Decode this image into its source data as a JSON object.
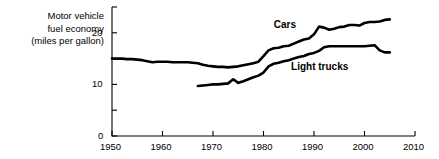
{
  "chart_data": {
    "type": "line",
    "title": "",
    "ylabel": "Motor vehicle fuel economy (miles per gallon)",
    "ylabel_lines": [
      "Motor vehicle",
      "fuel economy",
      "(miles per gallon)"
    ],
    "xlabel": "",
    "xlim": [
      1950,
      2010
    ],
    "ylim": [
      0,
      25
    ],
    "xticks": [
      1950,
      1960,
      1970,
      1980,
      1990,
      2000,
      2010
    ],
    "xtick_labels": [
      "1950",
      "1960",
      "1970",
      "1980",
      "1990",
      "2000",
      "2010"
    ],
    "yticks": [
      0,
      5,
      10,
      15,
      20,
      25
    ],
    "ytick_labels": [
      "0",
      "",
      "10",
      "",
      "20",
      ""
    ],
    "grid": false,
    "legend": "inline-annotations",
    "line_color": "#000000",
    "axis_color": "#000000",
    "background": "#ffffff",
    "series": [
      {
        "name": "Cars",
        "label_x": 1986,
        "label_y": 21.5,
        "x": [
          1950,
          1951,
          1952,
          1953,
          1954,
          1955,
          1956,
          1957,
          1958,
          1959,
          1960,
          1961,
          1962,
          1963,
          1964,
          1965,
          1966,
          1967,
          1968,
          1969,
          1970,
          1971,
          1972,
          1973,
          1974,
          1975,
          1976,
          1977,
          1978,
          1979,
          1980,
          1981,
          1982,
          1983,
          1984,
          1985,
          1986,
          1987,
          1988,
          1989,
          1990,
          1991,
          1992,
          1993,
          1994,
          1995,
          1996,
          1997,
          1998,
          1999,
          2000,
          2001,
          2002,
          2003,
          2004,
          2005
        ],
        "values": [
          15.0,
          15.0,
          15.0,
          14.9,
          14.9,
          14.8,
          14.7,
          14.5,
          14.3,
          14.4,
          14.4,
          14.4,
          14.3,
          14.3,
          14.3,
          14.3,
          14.2,
          14.1,
          13.8,
          13.6,
          13.5,
          13.4,
          13.4,
          13.3,
          13.4,
          13.5,
          13.7,
          13.9,
          14.1,
          14.4,
          15.5,
          16.6,
          17.0,
          17.1,
          17.4,
          17.5,
          17.9,
          18.3,
          18.7,
          18.9,
          19.7,
          21.2,
          21.0,
          20.6,
          20.8,
          21.1,
          21.2,
          21.5,
          21.5,
          21.4,
          21.9,
          22.1,
          22.1,
          22.2,
          22.5,
          22.6
        ]
      },
      {
        "name": "Light trucks",
        "label_x": 1991,
        "label_y": 13.3,
        "x": [
          1967,
          1968,
          1969,
          1970,
          1971,
          1972,
          1973,
          1974,
          1975,
          1976,
          1977,
          1978,
          1979,
          1980,
          1981,
          1982,
          1983,
          1984,
          1985,
          1986,
          1987,
          1988,
          1989,
          1990,
          1991,
          1992,
          1993,
          1994,
          1995,
          1996,
          1997,
          1998,
          1999,
          2000,
          2001,
          2002,
          2003,
          2004,
          2005
        ],
        "values": [
          9.7,
          9.8,
          9.9,
          10.0,
          10.0,
          10.1,
          10.2,
          11.0,
          10.3,
          10.6,
          11.0,
          11.4,
          11.7,
          12.3,
          13.5,
          14.0,
          14.2,
          14.5,
          14.7,
          15.0,
          15.3,
          15.5,
          15.9,
          16.1,
          16.5,
          17.2,
          17.4,
          17.4,
          17.4,
          17.4,
          17.4,
          17.4,
          17.4,
          17.4,
          17.5,
          17.6,
          16.6,
          16.2,
          16.2
        ]
      }
    ]
  },
  "figure": {
    "plot_left_px": 112,
    "plot_right_px": 415,
    "plot_top_px": 7,
    "plot_bottom_px": 136
  }
}
